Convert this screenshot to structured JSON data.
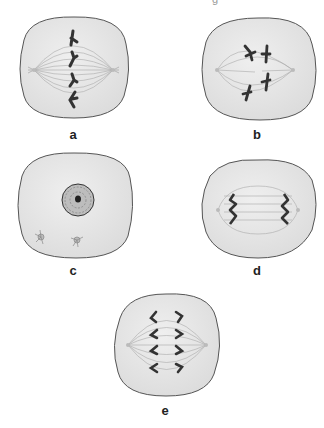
{
  "figure": {
    "top_cut_text": "g",
    "panels": [
      {
        "id": "a",
        "label": "a",
        "stage": "metaphase",
        "label_pos": [
          73,
          128
        ]
      },
      {
        "id": "b",
        "label": "b",
        "stage": "prometaphase",
        "label_pos": [
          257,
          128
        ]
      },
      {
        "id": "c",
        "label": "c",
        "stage": "interphase/prophase",
        "label_pos": [
          73,
          264
        ]
      },
      {
        "id": "d",
        "label": "d",
        "stage": "telophase",
        "label_pos": [
          257,
          264
        ]
      },
      {
        "id": "e",
        "label": "e",
        "stage": "anaphase",
        "label_pos": [
          165,
          404
        ]
      }
    ],
    "colors": {
      "cell_fill": "#e6e6e6",
      "cell_stroke": "#555555",
      "spindle": "#999999",
      "chromosome": "#3a3a3a"
    }
  }
}
